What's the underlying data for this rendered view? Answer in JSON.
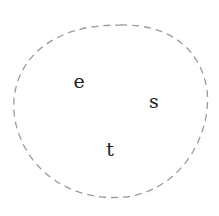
{
  "diagram": {
    "type": "set",
    "boundary": {
      "shape": "closed-curve",
      "style": "dashed",
      "stroke_color": "#9a9a9a"
    },
    "elements": [
      {
        "label": "e",
        "x": 79,
        "y": 88
      },
      {
        "label": "s",
        "x": 154,
        "y": 108
      },
      {
        "label": "t",
        "x": 110,
        "y": 156
      }
    ]
  }
}
